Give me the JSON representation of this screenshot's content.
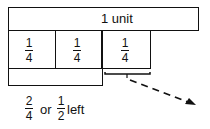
{
  "diagram": {
    "unit_label": "1 unit",
    "quarters": [
      {
        "num": "1",
        "den": "4"
      },
      {
        "num": "1",
        "den": "4"
      },
      {
        "num": "1",
        "den": "4"
      }
    ],
    "result": {
      "frac1": {
        "num": "2",
        "den": "4"
      },
      "or_text": "or",
      "frac2": {
        "num": "1",
        "den": "2"
      },
      "suffix": "left"
    }
  }
}
